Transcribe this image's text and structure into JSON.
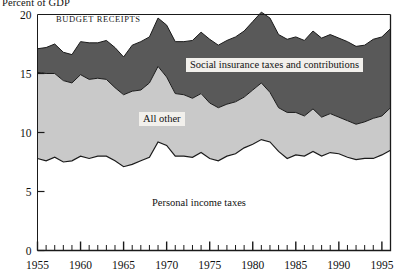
{
  "figure": {
    "y_axis_title": "Percent of GDP",
    "series_caption": "BUDGET RECEIPTS",
    "label_social": "Social insurance taxes and contributions",
    "label_other": "All other",
    "label_personal": "Personal income taxes"
  },
  "chart_data": {
    "type": "area",
    "title": "",
    "subtitle": "",
    "xlabel": "",
    "ylabel": "Percent of GDP",
    "xlim": [
      1955,
      1996
    ],
    "ylim": [
      0,
      20
    ],
    "yticks": [
      0,
      5,
      10,
      15,
      20
    ],
    "xticks": [
      1955,
      1960,
      1965,
      1970,
      1975,
      1980,
      1985,
      1990,
      1995
    ],
    "xtick_minor_step": 1,
    "grid": false,
    "legend": "inline-labels",
    "stacked": true,
    "colors": {
      "personal_income_taxes": "#ffffff",
      "all_other": "#c9c9c9",
      "social_insurance": "#595959",
      "axis": "#1a1a1a",
      "label_box": "#f2f0ec"
    },
    "x": [
      1955,
      1956,
      1957,
      1958,
      1959,
      1960,
      1961,
      1962,
      1963,
      1964,
      1965,
      1966,
      1967,
      1968,
      1969,
      1970,
      1971,
      1972,
      1973,
      1974,
      1975,
      1976,
      1977,
      1978,
      1979,
      1980,
      1981,
      1982,
      1983,
      1984,
      1985,
      1986,
      1987,
      1988,
      1989,
      1990,
      1991,
      1992,
      1993,
      1994,
      1995,
      1996
    ],
    "series": [
      {
        "name": "Personal income taxes",
        "values": [
          7.8,
          7.6,
          7.9,
          7.5,
          7.6,
          8.0,
          7.8,
          8.0,
          8.0,
          7.6,
          7.1,
          7.3,
          7.6,
          7.9,
          9.2,
          8.9,
          8.0,
          8.0,
          7.9,
          8.3,
          7.8,
          7.6,
          8.0,
          8.2,
          8.7,
          9.0,
          9.4,
          9.2,
          8.4,
          7.8,
          8.1,
          8.0,
          8.4,
          8.0,
          8.3,
          8.2,
          7.9,
          7.7,
          7.8,
          7.8,
          8.1,
          8.5
        ]
      },
      {
        "name": "All other",
        "values": [
          7.3,
          7.4,
          7.1,
          6.9,
          6.6,
          6.9,
          6.7,
          6.6,
          6.5,
          6.2,
          6.1,
          6.2,
          6.0,
          6.3,
          6.4,
          5.8,
          5.3,
          5.2,
          5.0,
          5.0,
          4.7,
          4.5,
          4.4,
          4.4,
          4.3,
          4.6,
          4.8,
          4.2,
          3.7,
          3.9,
          3.6,
          3.4,
          3.6,
          3.3,
          3.3,
          3.1,
          3.1,
          3.0,
          3.1,
          3.4,
          3.3,
          3.6
        ]
      },
      {
        "name": "Social insurance taxes and contributions",
        "values": [
          2.0,
          2.2,
          2.5,
          2.4,
          2.4,
          2.8,
          3.1,
          3.0,
          3.3,
          3.4,
          3.2,
          3.9,
          4.1,
          3.9,
          4.1,
          4.4,
          4.4,
          4.5,
          4.9,
          5.2,
          5.4,
          5.3,
          5.4,
          5.5,
          5.6,
          5.8,
          6.0,
          6.3,
          6.2,
          6.2,
          6.4,
          6.4,
          6.6,
          6.7,
          6.7,
          6.7,
          6.7,
          6.6,
          6.5,
          6.7,
          6.7,
          6.7
        ]
      }
    ]
  }
}
